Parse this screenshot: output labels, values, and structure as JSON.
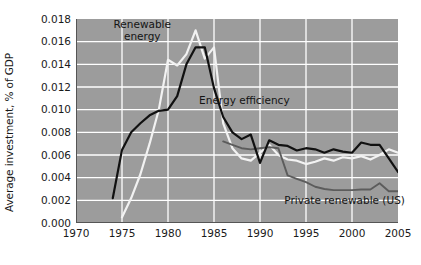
{
  "chart_data": {
    "type": "line",
    "title": "",
    "xlabel": "",
    "ylabel": "Average investment, % of GDP",
    "xlim": [
      1970,
      2005
    ],
    "ylim": [
      0.0,
      0.018
    ],
    "xticks": [
      1970,
      1975,
      1980,
      1985,
      1990,
      1995,
      2000,
      2005
    ],
    "xtick_labels": [
      "1970",
      "1975",
      "1980",
      "1985",
      "1990",
      "1995",
      "2000",
      "2005"
    ],
    "yticks": [
      0.0,
      0.002,
      0.004,
      0.006,
      0.008,
      0.01,
      0.012,
      0.014,
      0.016,
      0.018
    ],
    "ytick_labels": [
      "0.000",
      "0.002",
      "0.004",
      "0.006",
      "0.008",
      "0.010",
      "0.012",
      "0.014",
      "0.016",
      "0.018"
    ],
    "grid": true,
    "grid_color": "#ffffff",
    "plot_background": "#9c9c9c",
    "legend_position": "inline-annotations",
    "series": [
      {
        "name": "Energy efficiency",
        "color": "#111111",
        "label_x": 1988.3,
        "label_y": 0.01075,
        "x": [
          1974,
          1975,
          1976,
          1977,
          1978,
          1979,
          1980,
          1981,
          1982,
          1983,
          1984,
          1985,
          1986,
          1987,
          1988,
          1989,
          1990,
          1991,
          1992,
          1993,
          1994,
          1995,
          1996,
          1997,
          1998,
          1999,
          2000,
          2001,
          2002,
          2003,
          2004,
          2005
        ],
        "y": [
          0.0022,
          0.00645,
          0.008,
          0.0088,
          0.0095,
          0.0099,
          0.01,
          0.0112,
          0.014,
          0.0155,
          0.0155,
          0.0119,
          0.00935,
          0.008,
          0.0074,
          0.0078,
          0.0053,
          0.0073,
          0.0069,
          0.0068,
          0.0064,
          0.0066,
          0.0065,
          0.0062,
          0.0065,
          0.0063,
          0.0062,
          0.0071,
          0.0069,
          0.0069,
          0.0057,
          0.0045
        ]
      },
      {
        "name": "Renewable energy",
        "color": "#f2f2f2",
        "label_x": 1977.2,
        "label_y": 0.0169,
        "x": [
          1975,
          1976,
          1977,
          1978,
          1979,
          1980,
          1981,
          1982,
          1983,
          1984,
          1985,
          1986,
          1987,
          1988,
          1989,
          1990,
          1991,
          1992,
          1993,
          1994,
          1995,
          1996,
          1997,
          1998,
          1999,
          2000,
          2001,
          2002,
          2003,
          2004,
          2005
        ],
        "y": [
          0.0005,
          0.0022,
          0.0043,
          0.007,
          0.01,
          0.0144,
          0.0139,
          0.0149,
          0.017,
          0.0145,
          0.0155,
          0.0088,
          0.0066,
          0.0057,
          0.0055,
          0.0062,
          0.0069,
          0.006,
          0.0056,
          0.0055,
          0.0052,
          0.0054,
          0.0057,
          0.0055,
          0.0058,
          0.0057,
          0.0059,
          0.0056,
          0.006,
          0.0065,
          0.0062
        ]
      },
      {
        "name": "Private renewable (US)",
        "color": "#5c5c5c",
        "label_x": 1999.2,
        "label_y": 0.0019,
        "x": [
          1986,
          1987,
          1988,
          1989,
          1990,
          1991,
          1992,
          1993,
          1994,
          1995,
          1996,
          1997,
          1998,
          1999,
          2000,
          2001,
          2002,
          2003,
          2004,
          2005
        ],
        "y": [
          0.0072,
          0.0069,
          0.0066,
          0.0065,
          0.0066,
          0.0067,
          0.0066,
          0.0042,
          0.0039,
          0.0036,
          0.0032,
          0.003,
          0.0029,
          0.0029,
          0.0029,
          0.00295,
          0.00295,
          0.0035,
          0.0028,
          0.0028
        ]
      }
    ],
    "annotations": [
      {
        "text_line_1": "Renewable",
        "text_line_2": "energy"
      },
      {
        "text_line_1": "Energy efficiency",
        "text_line_2": ""
      },
      {
        "text_line_1": "Private renewable (US)",
        "text_line_2": ""
      }
    ]
  },
  "axes": {
    "ylabel": "Average investment, % of GDP",
    "ytick_labels": [
      "0.018",
      "0.016",
      "0.014",
      "0.012",
      "0.010",
      "0.008",
      "0.006",
      "0.004",
      "0.002",
      "0.000"
    ],
    "xtick_labels": [
      "1970",
      "1975",
      "1980",
      "1985",
      "1990",
      "1995",
      "2000",
      "2005"
    ]
  },
  "labels": {
    "renewable_energy_line1": "Renewable",
    "renewable_energy_line2": "energy",
    "energy_efficiency": "Energy efficiency",
    "private_renewable_us": "Private renewable (US)"
  },
  "colors": {
    "plot_background": "#9c9c9c",
    "grid": "#ffffff",
    "energy_efficiency": "#111111",
    "renewable_energy": "#f2f2f2",
    "private_renewable": "#5c5c5c",
    "text": "#1a1a1a"
  }
}
